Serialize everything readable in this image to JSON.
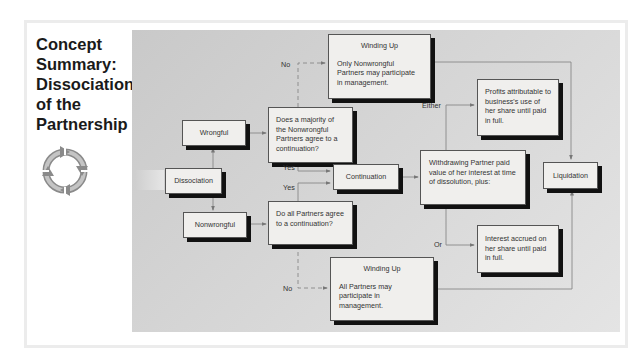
{
  "title": {
    "line1": "Concept",
    "line2": "Summary:",
    "line3": "Dissociation",
    "line4": "of the",
    "line5": "Partnership"
  },
  "icon": "cycle-arrows-icon",
  "colors": {
    "panel": "#d2d2d2",
    "box_fill": "#f0efed",
    "box_shadow": "#111111",
    "title": "#1a1a1a"
  },
  "nodes": {
    "dissociation": "Dissociation",
    "wrongful": "Wrongful",
    "nonwrongful": "Nonwrongful",
    "majority_question": "Does a majority of the Nonwrongful Partners agree to a continuation?",
    "all_question": "Do all Partners agree to a continuation?",
    "continuation": "Continuation",
    "winding_up_top": {
      "title": "Winding Up",
      "body": "Only Nonwrongful Partners may participate in management."
    },
    "winding_up_bottom": {
      "title": "Winding Up",
      "body": "All Partners may participate in management."
    },
    "withdrawing": "Withdrawing Partner paid value of her interest at time of dissolution, plus:",
    "profits": "Profits attributable to business's use of her share until paid in full.",
    "interest": "Interest accrued on her share until paid in full.",
    "liquidation": "Liquidation"
  },
  "edge_labels": {
    "no_top": "No",
    "yes_top": "Yes",
    "yes_bottom": "Yes",
    "no_bottom": "No",
    "either": "Either",
    "or": "Or"
  }
}
